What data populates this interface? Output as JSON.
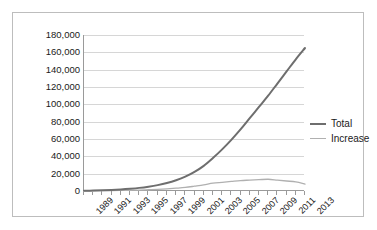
{
  "chart_data": {
    "type": "line",
    "title": "",
    "subtitle": "",
    "xlabel": "",
    "ylabel": "",
    "grid": "horizontal",
    "legend_position": "right",
    "xlim": [
      1989,
      2013
    ],
    "ylim": [
      0,
      180000
    ],
    "ytick_step": 20000,
    "x": [
      1989,
      1990,
      1991,
      1992,
      1993,
      1994,
      1995,
      1996,
      1997,
      1998,
      1999,
      2000,
      2001,
      2002,
      2003,
      2004,
      2005,
      2006,
      2007,
      2008,
      2009,
      2010,
      2011,
      2012,
      2013
    ],
    "x_tick_labels": [
      "1989",
      "",
      "1991",
      "",
      "1993",
      "",
      "1995",
      "",
      "1997",
      "",
      "1999",
      "",
      "2001",
      "",
      "2003",
      "",
      "2005",
      "",
      "2007",
      "",
      "2009",
      "",
      "2011",
      "",
      "2013"
    ],
    "y_tick_labels": [
      "0",
      "20,000",
      "40,000",
      "60,000",
      "80,000",
      "100,000",
      "120,000",
      "140,000",
      "160,000",
      "180,000"
    ],
    "y_tick_values": [
      0,
      20000,
      40000,
      60000,
      80000,
      100000,
      120000,
      140000,
      160000,
      180000
    ],
    "series": [
      {
        "name": "Total",
        "color": "#6e6e6e",
        "width": 2.0,
        "values": [
          300,
          500,
          800,
          1200,
          1800,
          2600,
          3600,
          5000,
          6800,
          9200,
          12400,
          16500,
          22000,
          29000,
          38000,
          48000,
          59000,
          71000,
          84000,
          97000,
          110000,
          124000,
          138000,
          152000,
          165000
        ]
      },
      {
        "name": "Increase",
        "color": "#b0b0b0",
        "width": 1.3,
        "values": [
          200,
          250,
          350,
          450,
          650,
          850,
          1050,
          1450,
          1850,
          2450,
          3250,
          4150,
          5550,
          7050,
          9050,
          10050,
          11050,
          12050,
          12550,
          13050,
          13550,
          12550,
          11550,
          10550,
          8050
        ]
      }
    ]
  },
  "legend": {
    "items": [
      {
        "label": "Total",
        "color": "#6e6e6e",
        "width": 2.0
      },
      {
        "label": "Increase",
        "color": "#b0b0b0",
        "width": 1.3
      }
    ]
  }
}
